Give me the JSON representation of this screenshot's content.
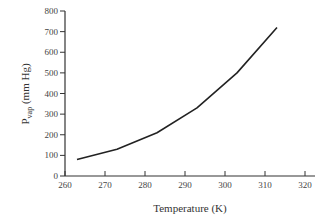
{
  "chart_data": {
    "type": "line",
    "title": "",
    "xlabel": "Temperature (K)",
    "ylabel": "P_vap (mm Hg)",
    "ylabel_main": "P",
    "ylabel_sub": "vap",
    "ylabel_unit": " (mm Hg)",
    "xlim": [
      260,
      320
    ],
    "ylim": [
      0,
      800
    ],
    "xticks": [
      260,
      270,
      280,
      290,
      300,
      310,
      320
    ],
    "yticks": [
      0,
      100,
      200,
      300,
      400,
      500,
      600,
      700,
      800
    ],
    "grid": false,
    "legend": null,
    "series": [
      {
        "name": "Vapor pressure",
        "color": "#222222",
        "x": [
          263,
          273,
          283,
          293,
          303,
          313
        ],
        "y": [
          80,
          130,
          210,
          330,
          500,
          720
        ]
      }
    ]
  }
}
